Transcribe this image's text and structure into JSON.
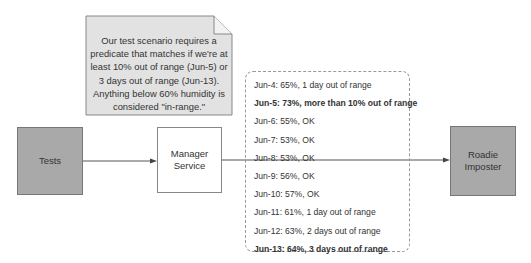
{
  "note": {
    "lines": [
      "Our test scenario requires a",
      "predicate that matches if we're at",
      "least 10% out of range (Jun-5) or",
      "3 days out of range (Jun-13).",
      "Anything below 60% humidity is",
      "considered \"in-range.\""
    ]
  },
  "nodes": {
    "tests": "Tests",
    "manager_line1": "Manager",
    "manager_line2": "Service",
    "roadie_line1": "Roadie",
    "roadie_line2": "Imposter"
  },
  "data_list": [
    {
      "text": "Jun-4: 65%, 1 day out of range",
      "bold": false
    },
    {
      "text": "Jun-5: 73%, more than 10% out of range",
      "bold": true
    },
    {
      "text": "Jun-6: 55%, OK",
      "bold": false
    },
    {
      "text": "Jun-7: 53%, OK",
      "bold": false
    },
    {
      "text": "Jun-8: 53%, OK",
      "bold": false
    },
    {
      "text": "Jun-9: 56%, OK",
      "bold": false
    },
    {
      "text": "Jun-10: 57%, OK",
      "bold": false
    },
    {
      "text": "Jun-11: 61%, 1 day out of range",
      "bold": false
    },
    {
      "text": "Jun-12: 63%, 2 days out of range",
      "bold": false
    },
    {
      "text": "Jun-13: 64%, 3 days out of range",
      "bold": true
    }
  ],
  "colors": {
    "gray_box": "#a9a9a9",
    "note_fill": "#e2e2e2",
    "line": "#555555"
  }
}
